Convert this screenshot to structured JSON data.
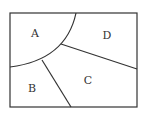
{
  "diagram": {
    "type": "region-partition",
    "stroke_color": "#333333",
    "background": "#ffffff",
    "regions": [
      {
        "id": "A",
        "label": "A"
      },
      {
        "id": "B",
        "label": "B"
      },
      {
        "id": "C",
        "label": "C"
      },
      {
        "id": "D",
        "label": "D"
      }
    ]
  }
}
